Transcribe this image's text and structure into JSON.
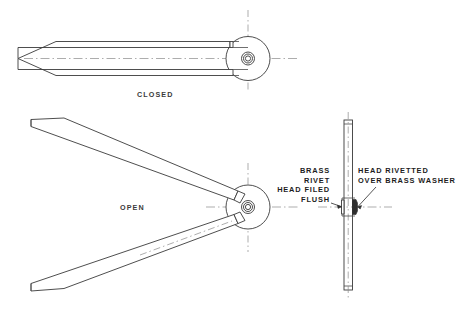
{
  "drawing": {
    "background_color": "#ffffff",
    "line_color": "#3a3a3a",
    "centerline_color": "#8a8a8a",
    "text_color": "#1d1d1d",
    "views": {
      "closed": {
        "label": "CLOSED",
        "label_x": 137,
        "label_y": 97
      },
      "open": {
        "label": "OPEN",
        "label_x": 120,
        "label_y": 210
      },
      "side": {
        "label": ""
      }
    },
    "notes": {
      "left_note": {
        "lines": [
          "BRASS",
          "RIVET",
          "HEAD FILED",
          "FLUSH"
        ],
        "align": "right",
        "anchor_x": 330,
        "first_line_y": 173,
        "line_height": 9.6
      },
      "right_note": {
        "lines": [
          "HEAD RIVETTED",
          "OVER BRASS WASHER"
        ],
        "align": "left",
        "anchor_x": 358,
        "first_line_y": 173,
        "line_height": 9.6
      }
    }
  }
}
